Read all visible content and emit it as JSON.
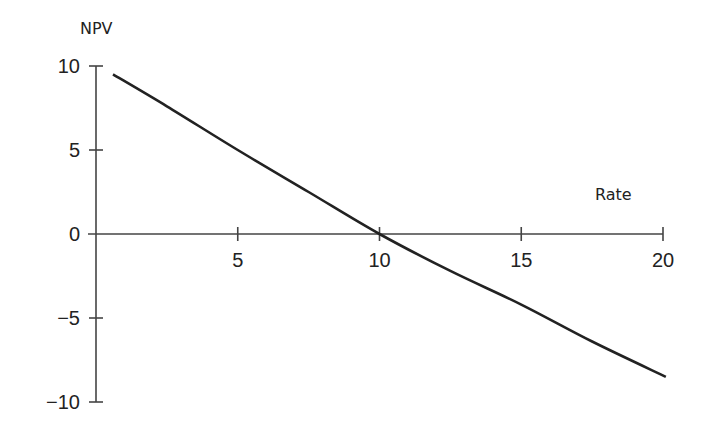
{
  "chart_data": {
    "type": "line",
    "title": "",
    "xlabel": "Rate",
    "ylabel": "NPV",
    "xlim": [
      0,
      20
    ],
    "ylim": [
      -10,
      10
    ],
    "x_ticks": [
      5,
      10,
      15,
      20
    ],
    "x_tick_labels": [
      "5",
      "10",
      "15",
      "20"
    ],
    "y_ticks": [
      10,
      5,
      0,
      -5,
      -10
    ],
    "y_tick_labels": [
      "10",
      "5",
      "0",
      "−5",
      "−10"
    ],
    "grid": false,
    "legend": null,
    "series": [
      {
        "name": "NPV",
        "x": [
          0.6,
          2.5,
          5,
          7.5,
          10,
          12.5,
          15,
          17.5,
          20.1
        ],
        "y": [
          9.5,
          7.6,
          5.0,
          2.5,
          0.0,
          -2.2,
          -4.2,
          -6.4,
          -8.5
        ],
        "color": "#222222"
      }
    ]
  }
}
